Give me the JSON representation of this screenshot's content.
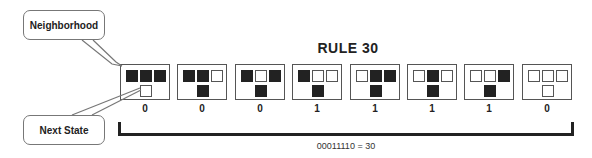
{
  "title": "RULE 30",
  "callouts": {
    "neighborhood": "Neighborhood",
    "next_state": "Next State"
  },
  "rules": [
    {
      "neighborhood": [
        1,
        1,
        1
      ],
      "next": 0,
      "bit": "0"
    },
    {
      "neighborhood": [
        1,
        1,
        0
      ],
      "next": 1,
      "bit": "0"
    },
    {
      "neighborhood": [
        1,
        0,
        1
      ],
      "next": 1,
      "bit": "0"
    },
    {
      "neighborhood": [
        1,
        0,
        0
      ],
      "next": 1,
      "bit": "1"
    },
    {
      "neighborhood": [
        0,
        1,
        1
      ],
      "next": 1,
      "bit": "1"
    },
    {
      "neighborhood": [
        0,
        1,
        0
      ],
      "next": 1,
      "bit": "1"
    },
    {
      "neighborhood": [
        0,
        0,
        1
      ],
      "next": 1,
      "bit": "1"
    },
    {
      "neighborhood": [
        0,
        0,
        0
      ],
      "next": 0,
      "bit": "0"
    }
  ],
  "formula": "00011110 = 30",
  "colors": {
    "filled": "#222222",
    "empty": "#ffffff",
    "border": "#555555"
  }
}
